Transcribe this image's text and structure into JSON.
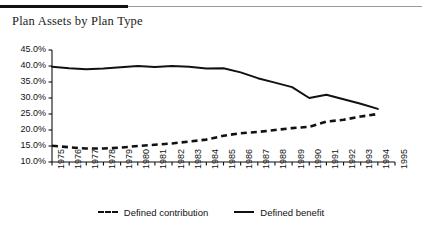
{
  "header": {
    "rule": "header-rule"
  },
  "chart_data": {
    "type": "line",
    "title": "Plan Assets by Plan Type",
    "xlabel": "",
    "ylabel": "",
    "ylim": [
      10,
      45
    ],
    "ytick_step": 5,
    "grid": false,
    "legend_position": "bottom",
    "ytick_labels": [
      "45.0%",
      "40.0%",
      "35.0%",
      "30.0%",
      "25.0%",
      "20.0%",
      "15.0%",
      "10.0%"
    ],
    "categories": [
      "1975",
      "1976",
      "1977",
      "1978",
      "1979",
      "1980",
      "1981",
      "1982",
      "1983",
      "1984",
      "1985",
      "1986",
      "1987",
      "1988",
      "1989",
      "1990",
      "1991",
      "1992",
      "1993",
      "1994",
      "1995"
    ],
    "series": [
      {
        "name": "Defined benefit",
        "style": "solid",
        "color": "#111111",
        "values": [
          39.8,
          39.3,
          39.0,
          39.2,
          39.6,
          40.0,
          39.7,
          40.0,
          39.8,
          39.2,
          39.3,
          38.0,
          36.2,
          34.8,
          33.4,
          30.0,
          31.0,
          29.6,
          28.2,
          26.6,
          null
        ]
      },
      {
        "name": "Defined contribution",
        "style": "dashed",
        "color": "#111111",
        "values": [
          15.1,
          14.6,
          14.2,
          14.2,
          14.5,
          15.0,
          15.4,
          15.8,
          16.4,
          17.0,
          18.2,
          19.0,
          19.4,
          20.0,
          20.6,
          21.0,
          22.6,
          23.2,
          24.2,
          25.0,
          null
        ]
      }
    ]
  },
  "legend": {
    "items": [
      {
        "label": "Defined contribution",
        "style": "dashed"
      },
      {
        "label": "Defined benefit",
        "style": "solid"
      }
    ]
  }
}
